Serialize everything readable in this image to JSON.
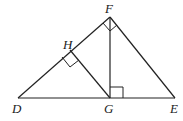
{
  "diagram": {
    "points": {
      "D": {
        "label": "D",
        "x": 18,
        "y": 98
      },
      "G": {
        "label": "G",
        "x": 110,
        "y": 98
      },
      "E": {
        "label": "E",
        "x": 175,
        "y": 98
      },
      "F": {
        "label": "F",
        "x": 110,
        "y": 17
      },
      "H": {
        "label": "H",
        "x": 70,
        "y": 50
      }
    },
    "segments": [
      "DE",
      "DF",
      "FE",
      "FG",
      "GH"
    ],
    "right_angles": [
      "DFE",
      "FGE",
      "DHG"
    ],
    "stroke_color": "#222222"
  }
}
